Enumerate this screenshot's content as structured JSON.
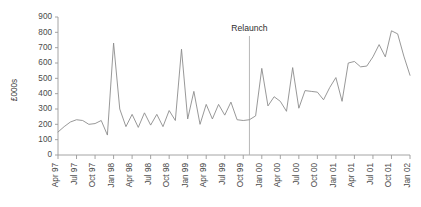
{
  "chart_data": {
    "type": "line",
    "title": "",
    "xlabel": "",
    "ylabel": "£000s",
    "ylim": [
      0,
      900
    ],
    "ytick_step": 100,
    "yticks": [
      0,
      100,
      200,
      300,
      400,
      500,
      600,
      700,
      800,
      900
    ],
    "grid": false,
    "legend": "none",
    "series_color": "#8c8c8c",
    "axis_color": "#9a9a9a",
    "annotations": [
      {
        "label": "Relaunch",
        "x": "Nov 99",
        "type": "vertical-line-with-label"
      }
    ],
    "xtick_labels": [
      "Apr 97",
      "Jul 97",
      "Oct 97",
      "Jan 98",
      "Apr 98",
      "Jul 98",
      "Oct 98",
      "Jan 99",
      "Apr 99",
      "Jul 99",
      "Oct 99",
      "Jan 00",
      "Apr 00",
      "Jul 00",
      "Oct 00",
      "Jan 01",
      "Apr 01",
      "Jul 01",
      "Oct 01",
      "Jan 02"
    ],
    "x": [
      "Apr 97",
      "May 97",
      "Jun 97",
      "Jul 97",
      "Aug 97",
      "Sep 97",
      "Oct 97",
      "Nov 97",
      "Dec 97",
      "Jan 98",
      "Feb 98",
      "Mar 98",
      "Apr 98",
      "May 98",
      "Jun 98",
      "Jul 98",
      "Aug 98",
      "Sep 98",
      "Oct 98",
      "Nov 98",
      "Dec 98",
      "Jan 99",
      "Feb 99",
      "Mar 99",
      "Apr 99",
      "May 99",
      "Jun 99",
      "Jul 99",
      "Aug 99",
      "Sep 99",
      "Oct 99",
      "Nov 99",
      "Dec 99",
      "Jan 00",
      "Feb 00",
      "Mar 00",
      "Apr 00",
      "May 00",
      "Jun 00",
      "Jul 00",
      "Aug 00",
      "Sep 00",
      "Oct 00",
      "Nov 00",
      "Dec 00",
      "Jan 01",
      "Feb 01",
      "Mar 01",
      "Apr 01",
      "May 01",
      "Jun 01",
      "Jul 01",
      "Aug 01",
      "Sep 01",
      "Oct 01",
      "Nov 01",
      "Dec 01",
      "Jan 02"
    ],
    "values": [
      150,
      185,
      215,
      230,
      225,
      200,
      205,
      225,
      130,
      730,
      300,
      185,
      265,
      180,
      275,
      195,
      265,
      185,
      290,
      225,
      690,
      235,
      415,
      200,
      330,
      235,
      330,
      260,
      345,
      230,
      225,
      230,
      255,
      565,
      320,
      380,
      350,
      285,
      570,
      305,
      420,
      415,
      410,
      360,
      440,
      505,
      350,
      600,
      610,
      575,
      580,
      640,
      720,
      640,
      810,
      790,
      645,
      520
    ]
  },
  "axis": {
    "y_title": "£000s"
  }
}
